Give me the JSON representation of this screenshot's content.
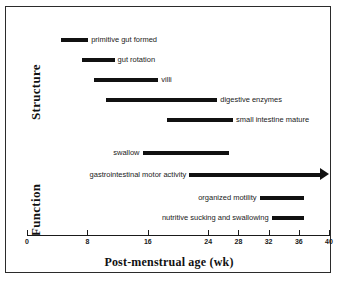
{
  "chart_data": {
    "type": "bar",
    "orientation": "horizontal",
    "title": "",
    "xlabel": "Post-menstrual age (wk)",
    "ylabel": "",
    "xlim": [
      0,
      40
    ],
    "xticks": [
      0,
      8,
      16,
      24,
      28,
      32,
      36,
      40
    ],
    "xtick_labels": [
      "0",
      "8",
      "16",
      "24",
      "28",
      "32",
      "36",
      "40"
    ],
    "grid": false,
    "legend": "none",
    "groups": [
      {
        "name": "Structure",
        "bars": [
          {
            "label": "primitive gut formed",
            "start": 4.5,
            "end": 8.1,
            "label_side": "right",
            "arrow": false
          },
          {
            "label": "gut rotation",
            "start": 7.3,
            "end": 11.6,
            "label_side": "right",
            "arrow": false
          },
          {
            "label": "villi",
            "start": 8.9,
            "end": 17.4,
            "label_side": "right",
            "arrow": false
          },
          {
            "label": "digestive enzymes",
            "start": 10.5,
            "end": 25.2,
            "label_side": "right",
            "arrow": false
          },
          {
            "label": "small intestine mature",
            "start": 18.6,
            "end": 27.3,
            "label_side": "right",
            "arrow": false
          }
        ]
      },
      {
        "name": "Function",
        "bars": [
          {
            "label": "swallow",
            "start": 15.3,
            "end": 26.7,
            "label_side": "left",
            "arrow": false
          },
          {
            "label": "gastrointestinal motor activity",
            "start": 21.5,
            "end": 40.0,
            "label_side": "left",
            "arrow": true
          },
          {
            "label": "organized motility",
            "start": 30.8,
            "end": 36.7,
            "label_side": "left",
            "arrow": false
          },
          {
            "label": "nutritive sucking and swallowing",
            "start": 32.4,
            "end": 36.7,
            "label_side": "left",
            "arrow": false
          }
        ]
      }
    ],
    "colors": {
      "bar": "#111111",
      "axis": "#1a1a1a",
      "frame": "#2b2b2b",
      "background": "#ffffff"
    }
  }
}
